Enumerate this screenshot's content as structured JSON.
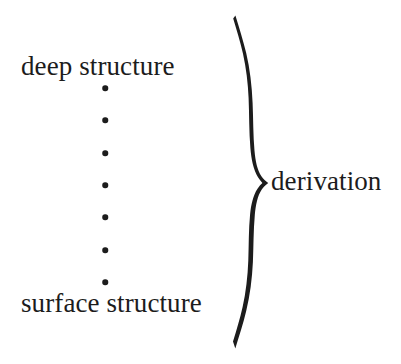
{
  "figure": {
    "background_color": "#ffffff",
    "ink_color": "#1c1c1c",
    "width": 401,
    "height": 364
  },
  "labels": {
    "deep_structure": "deep structure",
    "surface_structure": "surface structure",
    "derivation": "derivation"
  },
  "dots": {
    "count": 7,
    "center_x": 105,
    "diameter": 5.5,
    "positions_y": [
      88,
      120,
      153,
      185,
      217,
      250,
      282
    ]
  },
  "brace": {
    "orientation": "right-pointing",
    "top_y": 18,
    "bottom_y": 348,
    "cusp_x": 262,
    "cusp_y": 183,
    "tail_x": 233,
    "spine_x": 247
  }
}
